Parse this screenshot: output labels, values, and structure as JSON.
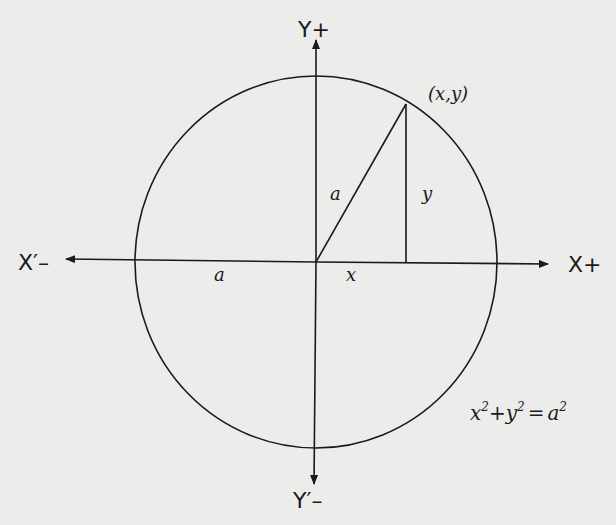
{
  "diagram": {
    "colors": {
      "background": "#ececea",
      "ink": "#1a1a1a"
    },
    "axes": {
      "x_positive_label": "X+",
      "x_negative_label": "X′–",
      "y_positive_label": "Y+",
      "y_negative_label": "Y′–"
    },
    "point_label": "(x,y)",
    "labels": {
      "radius_to_point": "a",
      "radius_on_axis": "a",
      "x_segment": "x",
      "y_segment": "y"
    },
    "equation": {
      "x": "x",
      "x_exp": "2",
      "plus": "+",
      "y": "y",
      "y_exp": "2",
      "equals": "=",
      "a": "a",
      "a_exp": "2"
    }
  }
}
